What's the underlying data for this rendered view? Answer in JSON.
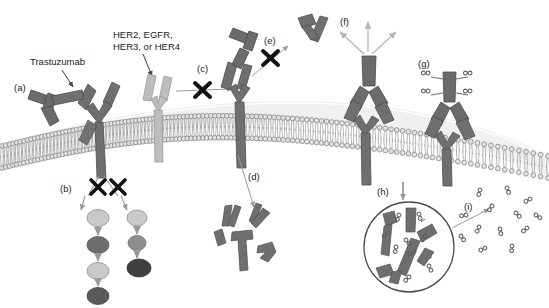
{
  "figure": {
    "width": 549,
    "height": 308,
    "background": "#ffffff"
  },
  "annotations": {
    "trastuzumab_label": "Trastuzumab",
    "receptor_label_line1": "HER2, EGFR,",
    "receptor_label_line2": "HER3, or HER4",
    "panel_a": "(a)",
    "panel_b": "(b)",
    "panel_c": "(c)",
    "panel_d": "(d)",
    "panel_e": "(e)",
    "panel_f": "(f)",
    "panel_g": "(g)",
    "panel_h": "(h)",
    "panel_i": "(i)",
    "block_mark": "✖"
  },
  "colors": {
    "antibody_dark": "#6e6e6e",
    "antibody_darker": "#5d5d5d",
    "receptor_dark": "#707070",
    "receptor_light": "#b8b8b8",
    "membrane_stroke": "#8c8c8c",
    "membrane_fill": "#d9d9d9",
    "arrow_gray": "#9a9a9a",
    "x_black": "#111111",
    "circle_light": "#c9c9c9",
    "circle_mid": "#8f8f8f",
    "circle_dark": "#555555",
    "drug_gray": "#6b6b6b",
    "text": "#1a1a1a",
    "vesicle_stroke": "#4a4a4a"
  },
  "membrane": {
    "description": "curved lipid bilayer spanning the figure",
    "head_count": 120
  },
  "signal_cascade": {
    "left_chain": [
      "#c9c9c9",
      "#6e6e6e",
      "#c9c9c9",
      "#5a5a5a"
    ],
    "right_chain": [
      "#c9c9c9",
      "#8f8f8f",
      "#3f3f3f"
    ]
  },
  "drug_molecules": {
    "conjugated_count": 4,
    "vesicle_count": 9,
    "released_count": 13
  },
  "elements": [
    {
      "id": "a",
      "name": "trastuzumab-binding-receptor",
      "caption": "(a)"
    },
    {
      "id": "b",
      "name": "blocked-downstream-signaling",
      "caption": "(b)"
    },
    {
      "id": "c",
      "name": "blocked-dimerization",
      "caption": "(c)"
    },
    {
      "id": "d",
      "name": "receptor-degradation-fragments",
      "caption": "(d)"
    },
    {
      "id": "e",
      "name": "blocked-ectodomain-shedding",
      "caption": "(e)"
    },
    {
      "id": "f",
      "name": "immune-cell-recruitment-adcc",
      "caption": "(f)"
    },
    {
      "id": "g",
      "name": "antibody-drug-conjugate",
      "caption": "(g)"
    },
    {
      "id": "h",
      "name": "internalization-lysosome",
      "caption": "(h)"
    },
    {
      "id": "i",
      "name": "released-cytotoxic-drug",
      "caption": "(i)"
    }
  ]
}
